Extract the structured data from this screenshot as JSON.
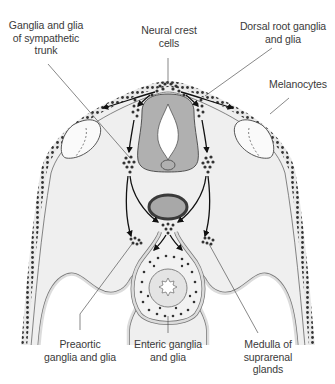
{
  "figure": {
    "colors": {
      "background": "#ffffff",
      "tissue": "#efefef",
      "neural_tube": "#b0b0b0",
      "aorta_wall": "#3a3a3a",
      "aorta_lumen": "#a8a8a8",
      "cells": "#333333",
      "lines": "#555555"
    }
  },
  "labels": {
    "neural_crest": "Neural crest\ncells",
    "dorsal_root": "Dorsal root ganglia\nand glia",
    "sympathetic": "Ganglia and glia\nof sympathetic\ntrunk",
    "melanocytes": "Melanocytes",
    "preaortic": "Preaortic\nganglia and glia",
    "enteric": "Enteric ganglia\nand glia",
    "suprarenal": "Medulla of\nsuprarenal\nglands"
  }
}
